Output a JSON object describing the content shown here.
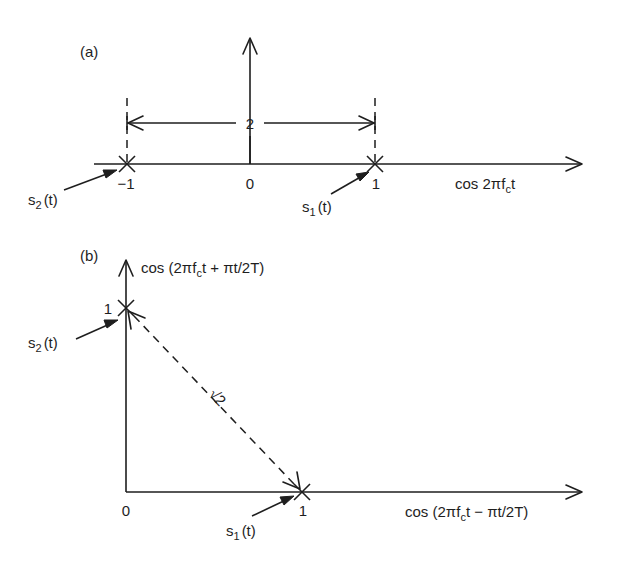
{
  "colors": {
    "ink": "#1e1e1e",
    "background": "#ffffff"
  },
  "panel_a": {
    "label": "(a)",
    "x_axis_label_prefix": "cos 2πf",
    "x_axis_label_sub": "c",
    "x_axis_label_suffix": "t",
    "tick_neg1": "−1",
    "tick_0": "0",
    "tick_1": "1",
    "distance_label": "2",
    "point_s1": {
      "name": "s",
      "sub": "1",
      "arg": "(t)",
      "coord": 1
    },
    "point_s2": {
      "name": "s",
      "sub": "2",
      "arg": "(t)",
      "coord": -1
    }
  },
  "panel_b": {
    "label": "(b)",
    "y_axis_label_prefix": "cos (2πf",
    "y_axis_label_sub": "c",
    "y_axis_label_suffix": "t + πt/2T)",
    "x_axis_label_prefix": "cos (2πf",
    "x_axis_label_sub": "c",
    "x_axis_label_suffix": "t − πt/2T)",
    "tick_origin": "0",
    "tick_x1": "1",
    "tick_y1": "1",
    "distance_label": "√2",
    "point_s1": {
      "name": "s",
      "sub": "1",
      "arg": "(t)",
      "coord": [
        1,
        0
      ]
    },
    "point_s2": {
      "name": "s",
      "sub": "2",
      "arg": "(t)",
      "coord": [
        0,
        1
      ]
    }
  }
}
